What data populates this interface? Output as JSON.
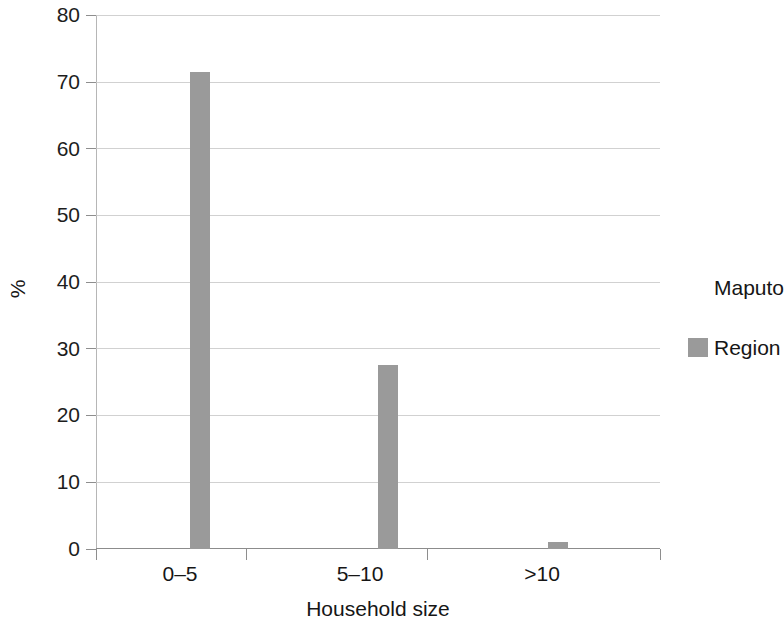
{
  "chart_data": {
    "type": "bar",
    "title": "",
    "subtitle": "",
    "xlabel": "Household size",
    "ylabel": "%",
    "categories": [
      "0–5",
      "5–10",
      ">10"
    ],
    "series": [
      {
        "name": "Maputo",
        "color": "#ffffff",
        "values": [
          0,
          0,
          0
        ]
      },
      {
        "name": "Region",
        "color": "#9a9a9a",
        "values": [
          71.5,
          27.5,
          1.0
        ]
      }
    ],
    "ylim": [
      0,
      80
    ],
    "yticks": [
      0,
      10,
      20,
      30,
      40,
      50,
      60,
      70,
      80
    ],
    "ytick_labels": [
      "0",
      "10",
      "20",
      "30",
      "40",
      "50",
      "60",
      "70",
      "80"
    ],
    "grid": "horizontal",
    "legend_position": "right",
    "legend_entries": [
      {
        "label": "Maputo",
        "color": "#ffffff"
      },
      {
        "label": "Region",
        "color": "#9a9a9a"
      }
    ]
  },
  "axes": {
    "y_title": "%",
    "x_title": "Household size",
    "y_tick_0": "0",
    "y_tick_10": "10",
    "y_tick_20": "20",
    "y_tick_30": "30",
    "y_tick_40": "40",
    "y_tick_50": "50",
    "y_tick_60": "60",
    "y_tick_70": "70",
    "y_tick_80": "80",
    "x_tick_1": "0–5",
    "x_tick_2": "5–10",
    "x_tick_3": ">10"
  },
  "legend": {
    "item_1": "Maputo",
    "item_2": "Region"
  }
}
